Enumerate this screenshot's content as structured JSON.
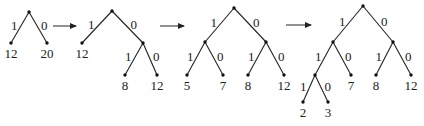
{
  "colors": {
    "ink": "#222222",
    "background": "#ffffff"
  },
  "trees": [
    {
      "id": "step1",
      "nodes": [
        {
          "id": "r",
          "x": 29,
          "y": 12
        },
        {
          "id": "a",
          "x": 11,
          "y": 43,
          "label": "12"
        },
        {
          "id": "b",
          "x": 47,
          "y": 43,
          "label": "20"
        }
      ],
      "edges": [
        {
          "from": "r",
          "to": "a",
          "bit": "1"
        },
        {
          "from": "r",
          "to": "b",
          "bit": "0"
        }
      ]
    },
    {
      "id": "step2",
      "nodes": [
        {
          "id": "r",
          "x": 112,
          "y": 11
        },
        {
          "id": "a",
          "x": 82,
          "y": 43,
          "label": "12"
        },
        {
          "id": "n",
          "x": 143,
          "y": 43
        },
        {
          "id": "c",
          "x": 125,
          "y": 75,
          "label": "8"
        },
        {
          "id": "d",
          "x": 157,
          "y": 75,
          "label": "12"
        }
      ],
      "edges": [
        {
          "from": "r",
          "to": "a",
          "bit": "1"
        },
        {
          "from": "r",
          "to": "n",
          "bit": "0"
        },
        {
          "from": "n",
          "to": "c",
          "bit": "1"
        },
        {
          "from": "n",
          "to": "d",
          "bit": "0"
        }
      ]
    },
    {
      "id": "step3",
      "nodes": [
        {
          "id": "r",
          "x": 234,
          "y": 8
        },
        {
          "id": "l",
          "x": 205,
          "y": 42
        },
        {
          "id": "n",
          "x": 266,
          "y": 42
        },
        {
          "id": "e",
          "x": 187,
          "y": 75,
          "label": "5"
        },
        {
          "id": "f",
          "x": 223,
          "y": 75,
          "label": "7"
        },
        {
          "id": "c",
          "x": 248,
          "y": 75,
          "label": "8"
        },
        {
          "id": "d",
          "x": 284,
          "y": 75,
          "label": "12"
        }
      ],
      "edges": [
        {
          "from": "r",
          "to": "l",
          "bit": "1"
        },
        {
          "from": "r",
          "to": "n",
          "bit": "0"
        },
        {
          "from": "l",
          "to": "e",
          "bit": "1"
        },
        {
          "from": "l",
          "to": "f",
          "bit": "0"
        },
        {
          "from": "n",
          "to": "c",
          "bit": "1"
        },
        {
          "from": "n",
          "to": "d",
          "bit": "0"
        }
      ]
    },
    {
      "id": "step4",
      "nodes": [
        {
          "id": "r",
          "x": 363,
          "y": 6
        },
        {
          "id": "l",
          "x": 333,
          "y": 42
        },
        {
          "id": "n",
          "x": 393,
          "y": 42
        },
        {
          "id": "ll",
          "x": 315,
          "y": 75
        },
        {
          "id": "f",
          "x": 351,
          "y": 75,
          "label": "7"
        },
        {
          "id": "c",
          "x": 376,
          "y": 75,
          "label": "8"
        },
        {
          "id": "d",
          "x": 411,
          "y": 75,
          "label": "12"
        },
        {
          "id": "g",
          "x": 303,
          "y": 102,
          "label": "2"
        },
        {
          "id": "h",
          "x": 328,
          "y": 102,
          "label": "3"
        }
      ],
      "edges": [
        {
          "from": "r",
          "to": "l",
          "bit": "1"
        },
        {
          "from": "r",
          "to": "n",
          "bit": "0"
        },
        {
          "from": "l",
          "to": "ll",
          "bit": "1"
        },
        {
          "from": "l",
          "to": "f",
          "bit": "0"
        },
        {
          "from": "ll",
          "to": "g",
          "bit": "1"
        },
        {
          "from": "ll",
          "to": "h",
          "bit": "0"
        },
        {
          "from": "n",
          "to": "c",
          "bit": "1"
        },
        {
          "from": "n",
          "to": "d",
          "bit": "0"
        }
      ]
    }
  ],
  "arrows": [
    {
      "x1": 53,
      "y1": 26,
      "x2": 76,
      "y2": 26
    },
    {
      "x1": 160,
      "y1": 26,
      "x2": 184,
      "y2": 26
    },
    {
      "x1": 286,
      "y1": 25,
      "x2": 311,
      "y2": 25
    }
  ]
}
